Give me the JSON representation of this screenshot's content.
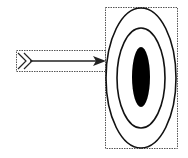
{
  "diagram": {
    "elements": [
      {
        "name": "arrow",
        "icon": "arrow-icon"
      },
      {
        "name": "target",
        "icon": "bullseye-icon",
        "rings": 3
      }
    ],
    "colors": {
      "stroke": "#111111",
      "fill_center": "#000000",
      "background": "#ffffff",
      "bounding_box": "#555555"
    }
  }
}
